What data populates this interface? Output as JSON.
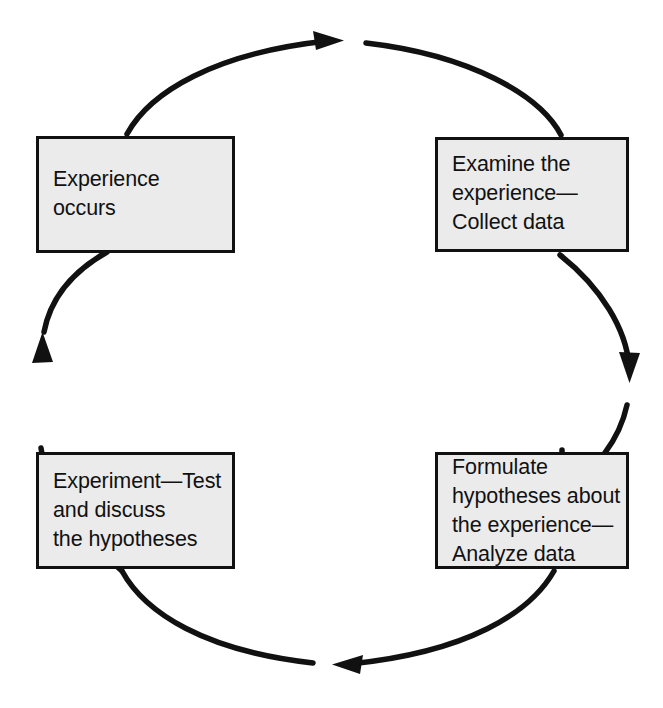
{
  "diagram": {
    "direction": "clockwise",
    "colors": {
      "box_fill": "#ebebeb",
      "box_border": "#111111",
      "arrow": "#111111",
      "background": "#ffffff",
      "text": "#111111"
    },
    "nodes": [
      {
        "id": "experience",
        "label": "Experience\noccurs",
        "position": "top-left"
      },
      {
        "id": "examine",
        "label": "Examine the\nexperience—\nCollect data",
        "position": "top-right"
      },
      {
        "id": "formulate",
        "label": "Formulate\nhypotheses about\nthe experience—\nAnalyze data",
        "position": "bottom-right"
      },
      {
        "id": "experiment",
        "label": "Experiment—Test\nand discuss\nthe hypotheses",
        "position": "bottom-left"
      }
    ],
    "arrows": [
      {
        "id": "arrow-top",
        "from": "experience",
        "to": "examine",
        "points": "right"
      },
      {
        "id": "arrow-right",
        "from": "examine",
        "to": "formulate",
        "points": "down"
      },
      {
        "id": "arrow-bottom",
        "from": "formulate",
        "to": "experiment",
        "points": "left"
      },
      {
        "id": "arrow-left",
        "from": "experiment",
        "to": "experience",
        "points": "up"
      }
    ]
  }
}
